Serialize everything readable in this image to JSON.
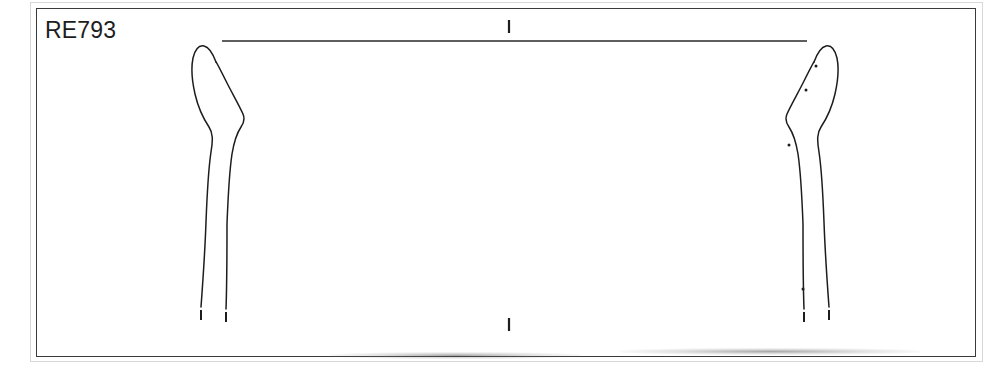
{
  "figure": {
    "label": "RE793",
    "type": "archaeological vessel profile drawing"
  },
  "plate": {
    "background_color": "#ffffff",
    "frame_color": "#3a3a3a",
    "outer_edge_color": "#d8d8d8",
    "ink_color": "#1d1d1d"
  },
  "rim_line": {
    "name": "rim-diameter-line",
    "x_start": 222,
    "x_end": 807,
    "y": 41,
    "color": "#2a2a2a"
  },
  "axis_ticks": [
    {
      "name": "top-centre-tick",
      "x": 509,
      "y_start": 20,
      "y_end": 33
    },
    {
      "name": "bottom-centre-tick",
      "x": 509,
      "y_start": 318,
      "y_end": 331
    }
  ],
  "profiles": [
    {
      "name": "left-profile",
      "side": "left",
      "outer_edge_path": "M 209 300 L 207 255 L 206 218 L 207 185 L 210 158 L 212 140 L 211 131 L 206 124 L 200 114 L 196 101 L 193 86 L 192 70 L 193 58 L 196 50 L 201 46 L 206 47 L 211 53 L 217 63",
      "inner_edge_path": "M 228 303 L 227 266 L 227 232 L 228 200 L 230 172 L 233 152 L 237 137 L 241 128 L 243 121 L 241 114 L 236 104 L 230 92 L 224 79 L 218 66 L 214 57",
      "dots": [],
      "broken_tips": [
        {
          "x": 201,
          "y_start": 308,
          "y_end": 318
        },
        {
          "x": 226,
          "y_start": 310,
          "y_end": 321
        }
      ]
    },
    {
      "name": "right-profile",
      "side": "right",
      "outer_edge_path": "M 821 300 L 823 255 L 824 218 L 823 185 L 820 158 L 818 140 L 819 131 L 824 124 L 830 114 L 834 101 L 837 86 L 838 70 L 837 58 L 834 50 L 829 46 L 824 47 L 819 53 L 813 63",
      "inner_edge_path": "M 802 303 L 803 266 L 803 232 L 802 200 L 800 172 L 797 152 L 793 137 L 789 128 L 787 121 L 789 114 L 794 104 L 800 92 L 806 79 L 812 66 L 816 57",
      "dots": [
        {
          "name": "inclusion-dot",
          "x": 816,
          "y": 66
        },
        {
          "name": "inclusion-dot",
          "x": 806,
          "y": 90
        },
        {
          "name": "inclusion-dot",
          "x": 789,
          "y": 145
        },
        {
          "name": "inclusion-dot",
          "x": 803,
          "y": 289
        }
      ],
      "broken_tips": [
        {
          "x": 829,
          "y_start": 308,
          "y_end": 318
        },
        {
          "x": 804,
          "y_start": 310,
          "y_end": 321
        }
      ]
    }
  ],
  "scan_shadows": [
    {
      "name": "shadow-left",
      "left": 330,
      "top": 352,
      "width": 250
    },
    {
      "name": "shadow-right",
      "left": 620,
      "top": 348,
      "width": 300
    }
  ]
}
